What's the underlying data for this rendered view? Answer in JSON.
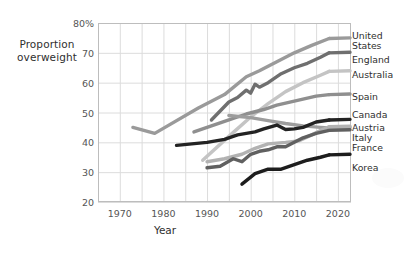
{
  "axes": {
    "y_title_line1": "Proportion",
    "y_title_line2": "overweight",
    "x_title": "Year",
    "y_ticks": [
      "80%",
      "70",
      "60",
      "50",
      "40",
      "30",
      "20"
    ],
    "x_ticks": [
      "1970",
      "1980",
      "1990",
      "2000",
      "2010",
      "2020"
    ]
  },
  "legend": {
    "items": [
      {
        "label_line1": "United",
        "label_line2": "States"
      },
      {
        "label_line1": "England",
        "label_line2": ""
      },
      {
        "label_line1": "Australia",
        "label_line2": ""
      },
      {
        "label_line1": "Spain",
        "label_line2": ""
      },
      {
        "label_line1": "Canada",
        "label_line2": ""
      },
      {
        "label_line1": "Austria",
        "label_line2": ""
      },
      {
        "label_line1": "Italy",
        "label_line2": ""
      },
      {
        "label_line1": "France",
        "label_line2": ""
      },
      {
        "label_line1": "Korea",
        "label_line2": ""
      }
    ]
  },
  "chart_data": {
    "type": "line",
    "title": "",
    "xlabel": "Year",
    "ylabel": "Proportion overweight",
    "xlim": [
      1965,
      2023
    ],
    "ylim": [
      20,
      80
    ],
    "yticks": [
      20,
      30,
      40,
      50,
      60,
      70,
      80
    ],
    "xticks": [
      1970,
      1980,
      1990,
      2000,
      2010,
      2020
    ],
    "grid": true,
    "legend_position": "right-outside",
    "series": [
      {
        "name": "United States",
        "color": "#9a9a9a",
        "points": [
          [
            1973,
            45.0
          ],
          [
            1978,
            43.0
          ],
          [
            1988,
            51.5
          ],
          [
            1994,
            56.0
          ],
          [
            1999,
            62.0
          ],
          [
            2002,
            64.0
          ],
          [
            2006,
            67.0
          ],
          [
            2010,
            70.0
          ],
          [
            2014,
            72.5
          ],
          [
            2018,
            74.8
          ]
        ]
      },
      {
        "name": "England",
        "color": "#6f6f6f",
        "points": [
          [
            1991,
            47.5
          ],
          [
            1993,
            50.5
          ],
          [
            1995,
            53.5
          ],
          [
            1997,
            55.0
          ],
          [
            1999,
            57.5
          ],
          [
            2000,
            56.5
          ],
          [
            2001,
            59.5
          ],
          [
            2002,
            58.5
          ],
          [
            2004,
            60.0
          ],
          [
            2007,
            63.0
          ],
          [
            2010,
            65.0
          ],
          [
            2013,
            66.5
          ],
          [
            2016,
            68.5
          ],
          [
            2018,
            70.0
          ]
        ]
      },
      {
        "name": "Australia",
        "color": "#c4c4c4",
        "points": [
          [
            1989,
            34.0
          ],
          [
            1995,
            42.0
          ],
          [
            2000,
            48.5
          ],
          [
            2004,
            53.0
          ],
          [
            2008,
            57.0
          ],
          [
            2012,
            60.0
          ],
          [
            2016,
            62.5
          ],
          [
            2018,
            63.8
          ]
        ]
      },
      {
        "name": "Spain",
        "color": "#8f8f8f",
        "points": [
          [
            1987,
            43.5
          ],
          [
            1991,
            45.5
          ],
          [
            1993,
            46.5
          ],
          [
            1995,
            47.5
          ],
          [
            1999,
            49.5
          ],
          [
            2003,
            51.0
          ],
          [
            2006,
            52.5
          ],
          [
            2009,
            53.5
          ],
          [
            2012,
            54.5
          ],
          [
            2015,
            55.5
          ],
          [
            2018,
            56.0
          ]
        ]
      },
      {
        "name": "Canada",
        "color": "#9d9d9d",
        "points": [
          [
            1995,
            49.0
          ],
          [
            2000,
            48.3
          ],
          [
            2004,
            47.3
          ],
          [
            2008,
            46.3
          ],
          [
            2012,
            45.5
          ],
          [
            2016,
            45.0
          ],
          [
            2018,
            44.8
          ]
        ]
      },
      {
        "name": "Austria",
        "color": "#232323",
        "points": [
          [
            1983,
            39.0
          ],
          [
            1990,
            40.0
          ],
          [
            1994,
            41.0
          ],
          [
            1997,
            42.5
          ],
          [
            1999,
            43.0
          ],
          [
            2001,
            43.5
          ],
          [
            2003,
            44.5
          ],
          [
            2006,
            45.8
          ],
          [
            2008,
            44.3
          ],
          [
            2010,
            44.5
          ],
          [
            2012,
            45.0
          ],
          [
            2015,
            46.8
          ],
          [
            2018,
            47.5
          ]
        ]
      },
      {
        "name": "Italy",
        "color": "#b2b2b2",
        "points": [
          [
            1990,
            33.5
          ],
          [
            1994,
            34.5
          ],
          [
            1998,
            36.0
          ],
          [
            2001,
            38.0
          ],
          [
            2004,
            39.5
          ],
          [
            2008,
            40.0
          ],
          [
            2011,
            40.5
          ],
          [
            2014,
            42.5
          ],
          [
            2016,
            44.0
          ],
          [
            2018,
            45.2
          ]
        ]
      },
      {
        "name": "France",
        "color": "#606060",
        "points": [
          [
            1990,
            31.5
          ],
          [
            1993,
            32.0
          ],
          [
            1996,
            34.5
          ],
          [
            1998,
            33.5
          ],
          [
            2000,
            36.0
          ],
          [
            2002,
            37.0
          ],
          [
            2004,
            37.5
          ],
          [
            2006,
            38.5
          ],
          [
            2008,
            38.5
          ],
          [
            2010,
            40.0
          ],
          [
            2012,
            41.5
          ],
          [
            2015,
            43.0
          ],
          [
            2018,
            44.0
          ]
        ]
      },
      {
        "name": "Korea",
        "color": "#1d1d1d",
        "points": [
          [
            1998,
            26.0
          ],
          [
            2001,
            29.5
          ],
          [
            2004,
            31.0
          ],
          [
            2007,
            31.0
          ],
          [
            2010,
            32.5
          ],
          [
            2013,
            34.0
          ],
          [
            2016,
            35.0
          ],
          [
            2018,
            35.8
          ]
        ]
      }
    ]
  },
  "legend_positions": [
    {
      "name": "United States",
      "top": 31
    },
    {
      "name": "England",
      "top": 55
    },
    {
      "name": "Australia",
      "top": 70
    },
    {
      "name": "Spain",
      "top": 92
    },
    {
      "name": "Canada",
      "top": 110
    },
    {
      "name": "Austria",
      "top": 123
    },
    {
      "name": "Italy",
      "top": 133
    },
    {
      "name": "France",
      "top": 143
    },
    {
      "name": "Korea",
      "top": 163
    }
  ]
}
